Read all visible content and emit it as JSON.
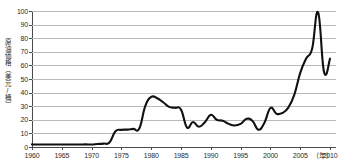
{
  "chart_data": {
    "type": "line",
    "title": "",
    "xlabel": "（年）",
    "ylabel": "原油価格（美元/桶）",
    "xlim": [
      1960,
      2011
    ],
    "ylim": [
      0,
      100
    ],
    "grid": true,
    "legend": false,
    "legend_position": "none",
    "x_tick_labels": [
      "1960",
      "1965",
      "1970",
      "1975",
      "1980",
      "1985",
      "1990",
      "1995",
      "2000",
      "2005",
      "2010"
    ],
    "x_ticks": [
      1960,
      1965,
      1970,
      1975,
      1980,
      1985,
      1990,
      1995,
      2000,
      2005,
      2010
    ],
    "y_tick_labels": [
      "0",
      "10",
      "20",
      "30",
      "40",
      "50",
      "60",
      "70",
      "80",
      "90",
      "100"
    ],
    "y_ticks": [
      0,
      10,
      20,
      30,
      40,
      50,
      60,
      70,
      80,
      90,
      100
    ],
    "series": [
      {
        "name": "原油価格",
        "color": "#111111",
        "x": [
          1960,
          1961,
          1962,
          1963,
          1964,
          1965,
          1966,
          1967,
          1968,
          1969,
          1970,
          1971,
          1972,
          1973,
          1974,
          1975,
          1976,
          1977,
          1978,
          1979,
          1980,
          1981,
          1982,
          1983,
          1984,
          1985,
          1986,
          1987,
          1988,
          1989,
          1990,
          1991,
          1992,
          1993,
          1994,
          1995,
          1996,
          1997,
          1998,
          1999,
          2000,
          2001,
          2002,
          2003,
          2004,
          2005,
          2006,
          2007,
          2008,
          2009,
          2010
        ],
        "values": [
          1.9,
          1.8,
          1.8,
          1.8,
          1.8,
          1.8,
          1.8,
          1.8,
          1.8,
          1.9,
          1.8,
          2.2,
          2.5,
          3.3,
          11.6,
          12.6,
          12.8,
          13.3,
          13.6,
          30.0,
          36.8,
          35.9,
          32.9,
          29.5,
          28.8,
          27.5,
          14.4,
          18.4,
          14.9,
          18.2,
          23.7,
          20.0,
          19.3,
          17.0,
          15.8,
          17.0,
          20.7,
          19.1,
          12.7,
          17.9,
          28.7,
          24.5,
          25.0,
          28.9,
          38.3,
          54.5,
          65.1,
          72.4,
          99.0,
          55.0,
          65.0
        ]
      }
    ]
  },
  "axes": {
    "y_title": "原油価格（美元/桶）",
    "x_title": "（年）"
  }
}
